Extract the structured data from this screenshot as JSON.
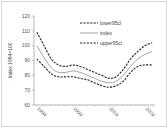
{
  "chart_data": {
    "type": "line",
    "title": "",
    "xlabel": "",
    "ylabel": "Index 1994=100",
    "ylim": [
      60,
      120
    ],
    "yticks": [
      "60",
      "70",
      "80",
      "90",
      "100",
      "110",
      "120"
    ],
    "xticks": [
      "1994",
      "1999",
      "2004",
      "2009"
    ],
    "grid": false,
    "legend_position": "upper right (inside)",
    "x": [
      1994,
      1995,
      1996,
      1997,
      1998,
      1999,
      2000,
      2001,
      2002,
      2003,
      2004,
      2005,
      2006,
      2007,
      2008,
      2009,
      2010
    ],
    "series": [
      {
        "name": "lower95cl",
        "style": "dashed",
        "values": [
          109,
          100,
          91,
          87,
          86,
          87,
          86,
          84,
          82,
          80,
          78,
          79,
          84,
          91,
          96,
          100,
          102
        ]
      },
      {
        "name": "index",
        "style": "solid",
        "values": [
          100,
          92,
          85,
          82,
          82,
          83,
          82,
          80,
          78,
          76,
          75,
          76,
          80,
          86,
          91,
          94,
          96
        ]
      },
      {
        "name": "upper95cl",
        "style": "dashed",
        "values": [
          91,
          86,
          81,
          79,
          79,
          79,
          78,
          77,
          75,
          73,
          72,
          73,
          76,
          82,
          86,
          87,
          87
        ]
      }
    ]
  },
  "legend": [
    {
      "label": "lower95cl",
      "style": "dashed"
    },
    {
      "label": "index",
      "style": "solid"
    },
    {
      "label": "upper95cl",
      "style": "dashed"
    }
  ]
}
